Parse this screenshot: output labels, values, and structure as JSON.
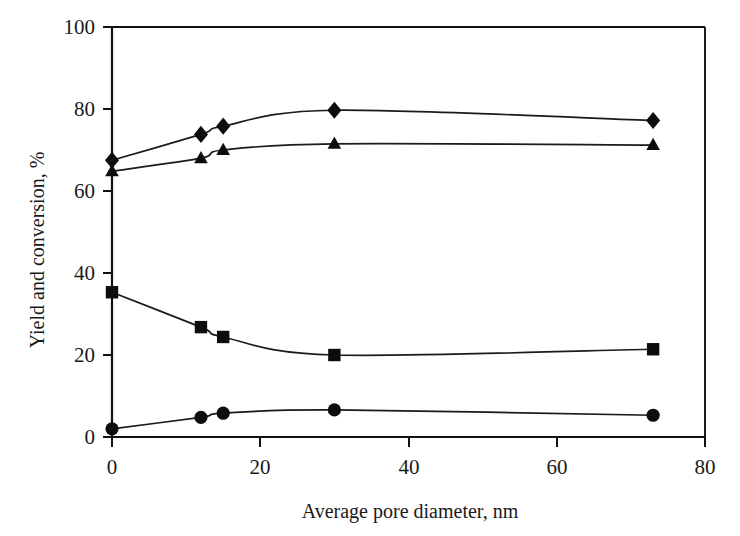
{
  "chart_data": {
    "type": "line",
    "title": "",
    "subtitle": "",
    "xlabel": "Average pore diameter, nm",
    "ylabel": "Yield and conversion, %",
    "xlim": [
      0,
      80
    ],
    "ylim": [
      0,
      100
    ],
    "xticks": [
      0,
      20,
      40,
      60,
      80
    ],
    "yticks": [
      0,
      20,
      40,
      60,
      80,
      100
    ],
    "xtick_labels": [
      "0",
      "20",
      "40",
      "60",
      "80"
    ],
    "ytick_labels": [
      "0",
      "20",
      "40",
      "60",
      "80",
      "100"
    ],
    "grid": false,
    "legend": "none",
    "marker_color": "#0d0d0d",
    "line_color": "#1b1b1b",
    "series": [
      {
        "name": "Conversion (diamonds)",
        "marker": "diamond",
        "x": [
          0,
          12,
          15,
          30,
          73
        ],
        "values": [
          67.5,
          73.8,
          75.8,
          79.7,
          77.2
        ]
      },
      {
        "name": "Yield (triangles)",
        "marker": "triangle",
        "x": [
          0,
          12,
          15,
          30,
          73
        ],
        "values": [
          64.8,
          68.0,
          70.0,
          71.5,
          71.2
        ]
      },
      {
        "name": "Yield (squares)",
        "marker": "square",
        "x": [
          0,
          12,
          15,
          30,
          73
        ],
        "values": [
          35.3,
          26.8,
          24.4,
          20.0,
          21.4
        ]
      },
      {
        "name": "Yield (circles)",
        "marker": "circle",
        "x": [
          0,
          12,
          15,
          30,
          73
        ],
        "values": [
          2.0,
          4.8,
          5.8,
          6.6,
          5.3
        ]
      }
    ]
  }
}
